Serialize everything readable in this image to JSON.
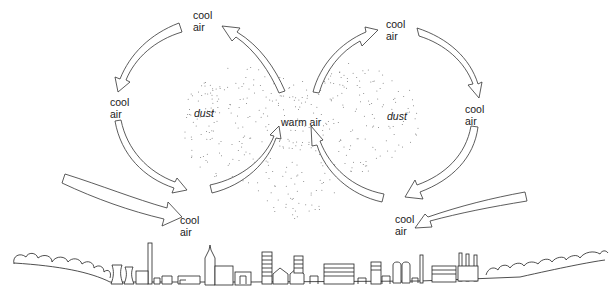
{
  "diagram": {
    "labels": {
      "cool_air_top_left": "cool\nair",
      "cool_air_top_right": "cool\nair",
      "cool_air_mid_left": "cool\nair",
      "cool_air_mid_right": "cool\nair",
      "cool_air_bottom_left": "cool\nair",
      "cool_air_bottom_right": "cool\nair",
      "warm_air": "warm air",
      "dust_left": "dust",
      "dust_right": "dust"
    },
    "arrows": [
      {
        "id": "left-top",
        "direction": "counter-clockwise, from top down-left"
      },
      {
        "id": "left-rising",
        "direction": "up toward top-left cool air"
      },
      {
        "id": "left-descending",
        "direction": "down from mid-left to bottom"
      },
      {
        "id": "left-up-center",
        "direction": "up into warm air"
      },
      {
        "id": "left-ground",
        "direction": "inflow toward city at ground"
      },
      {
        "id": "right-top",
        "direction": "clockwise, from top down-right"
      },
      {
        "id": "right-rising",
        "direction": "up toward top-right cool air"
      },
      {
        "id": "right-descending",
        "direction": "down from mid-right to bottom"
      },
      {
        "id": "right-up-center",
        "direction": "up into warm air"
      },
      {
        "id": "right-ground",
        "direction": "inflow toward city at ground"
      }
    ],
    "colors": {
      "stroke": "#333333",
      "fill": "#ffffff",
      "dust": "#777777",
      "text": "#1a1a1a"
    }
  }
}
